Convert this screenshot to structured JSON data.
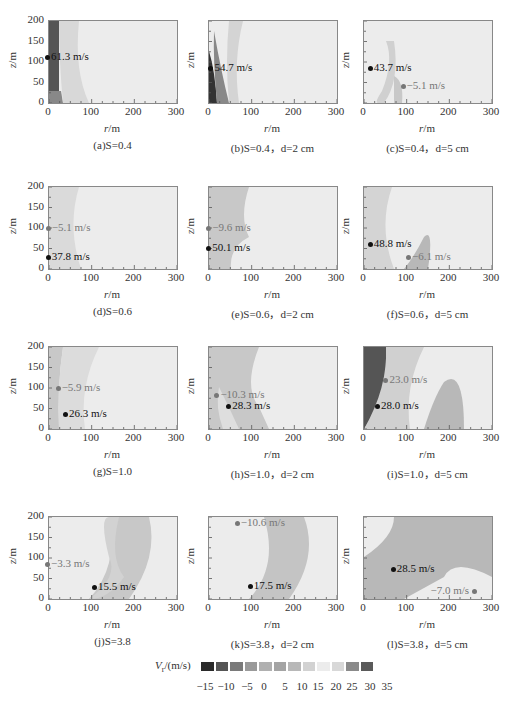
{
  "chart_data": {
    "type": "heatmap",
    "xlabel": "r/m",
    "ylabel": "z/m",
    "xlim": [
      0,
      300
    ],
    "ylim": [
      0,
      200
    ],
    "xticks": [
      "0",
      "100",
      "200",
      "300"
    ],
    "yticks": [
      "0",
      "50",
      "100",
      "150",
      "200"
    ],
    "colorbar": {
      "label": "V_r/(m/s)",
      "ticks": [
        "-15",
        "-10",
        "-5",
        "0",
        "5",
        "10",
        "15",
        "20",
        "25",
        "30",
        "35"
      ],
      "colors": [
        "#2a2a2a",
        "#555555",
        "#7a7a7a",
        "#9a9a9a",
        "#b0b0b0",
        "#a4a4a4",
        "#b8b8b8",
        "#d2d2d2",
        "#ececec",
        "#d8d8d8",
        "#8a8a8a",
        "#5a5a5a"
      ]
    },
    "panels": [
      {
        "id": "a",
        "caption": "(a)S=0.4",
        "S": 0.4,
        "d": null,
        "annotations": [
          {
            "label": "61.3 m/s",
            "r": 0,
            "z": 112,
            "type": "max"
          }
        ]
      },
      {
        "id": "b",
        "caption": "(b)S=0.4，d=2 cm",
        "S": 0.4,
        "d": "2 cm",
        "annotations": [
          {
            "label": "54.7 m/s",
            "r": 8,
            "z": 85,
            "type": "max"
          }
        ]
      },
      {
        "id": "c",
        "caption": "(c)S=0.4，d=5 cm",
        "S": 0.4,
        "d": "5 cm",
        "annotations": [
          {
            "label": "43.7 m/s",
            "r": 18,
            "z": 85,
            "type": "max"
          },
          {
            "label": "-5.1 m/s",
            "r": 95,
            "z": 42,
            "type": "min"
          }
        ]
      },
      {
        "id": "d",
        "caption": "(d)S=0.6",
        "S": 0.6,
        "d": null,
        "annotations": [
          {
            "label": "-5.1 m/s",
            "r": 2,
            "z": 100,
            "type": "min"
          },
          {
            "label": "37.8 m/s",
            "r": 2,
            "z": 30,
            "type": "max"
          }
        ]
      },
      {
        "id": "e",
        "caption": "(e)S=0.6，d=2 cm",
        "S": 0.6,
        "d": "2 cm",
        "annotations": [
          {
            "label": "-9.6 m/s",
            "r": 3,
            "z": 100,
            "type": "min"
          },
          {
            "label": "50.1 m/s",
            "r": 3,
            "z": 52,
            "type": "max"
          }
        ]
      },
      {
        "id": "f",
        "caption": "(f)S=0.6，d=5 cm",
        "S": 0.6,
        "d": "5 cm",
        "annotations": [
          {
            "label": "48.8 m/s",
            "r": 18,
            "z": 62,
            "type": "max"
          },
          {
            "label": "-6.1 m/s",
            "r": 108,
            "z": 30,
            "type": "min"
          }
        ]
      },
      {
        "id": "g",
        "caption": "(g)S=1.0",
        "S": 1.0,
        "d": null,
        "annotations": [
          {
            "label": "-5.9 m/s",
            "r": 25,
            "z": 100,
            "type": "min"
          },
          {
            "label": "26.3 m/s",
            "r": 42,
            "z": 36,
            "type": "max"
          }
        ]
      },
      {
        "id": "h",
        "caption": "(h)S=1.0，d=2 cm",
        "S": 1.0,
        "d": "2 cm",
        "annotations": [
          {
            "label": "-10.3 m/s",
            "r": 22,
            "z": 82,
            "type": "min"
          },
          {
            "label": "28.3 m/s",
            "r": 50,
            "z": 57,
            "type": "max"
          }
        ]
      },
      {
        "id": "i",
        "caption": "(i)S=1.0，d=5 cm",
        "S": 1.0,
        "d": "5 cm",
        "annotations": [
          {
            "label": "23.0 m/s",
            "r": 55,
            "z": 120,
            "type": "min"
          },
          {
            "label": "28.0 m/s",
            "r": 35,
            "z": 55,
            "type": "max"
          }
        ]
      },
      {
        "id": "j",
        "caption": "(j)S=3.8",
        "S": 3.8,
        "d": null,
        "annotations": [
          {
            "label": "-3.3 m/s",
            "r": 0,
            "z": 85,
            "type": "min"
          },
          {
            "label": "15.5 m/s",
            "r": 110,
            "z": 30,
            "type": "max"
          }
        ]
      },
      {
        "id": "k",
        "caption": "(k)S=3.8，d=2 cm",
        "S": 3.8,
        "d": "2 cm",
        "annotations": [
          {
            "label": "-10.6 m/s",
            "r": 70,
            "z": 185,
            "type": "min"
          },
          {
            "label": "17.5 m/s",
            "r": 100,
            "z": 32,
            "type": "max"
          }
        ]
      },
      {
        "id": "l",
        "caption": "(l)S=3.8，d=5 cm",
        "S": 3.8,
        "d": "5 cm",
        "annotations": [
          {
            "label": "28.5 m/s",
            "r": 72,
            "z": 72,
            "type": "max"
          },
          {
            "label": "-7.0 m/s",
            "r": 280,
            "z": 20,
            "type": "min"
          }
        ]
      }
    ]
  },
  "labels": {
    "xlabel_r": "r",
    "xlabel_unit": "/m",
    "ylabel_z": "z",
    "ylabel_unit": "/m",
    "colorbar_title": "V_r/(m/s)"
  }
}
